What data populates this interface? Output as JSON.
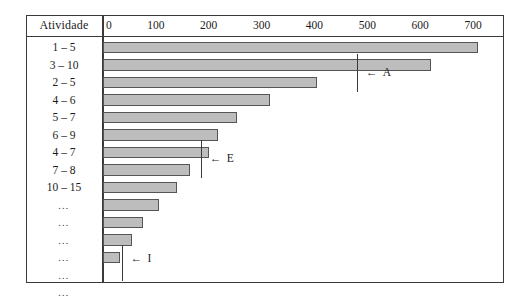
{
  "header": {
    "activity_column_label": "Atividade"
  },
  "axis": {
    "ticks": [
      "0",
      "100",
      "200",
      "300",
      "400",
      "500",
      "600",
      "700"
    ],
    "min": 0,
    "max": 760
  },
  "annotations": [
    {
      "id": "a",
      "label": "A",
      "arrow": "←",
      "value": 480
    },
    {
      "id": "e",
      "label": "E",
      "arrow": "←",
      "value": 185
    },
    {
      "id": "i",
      "label": "I",
      "arrow": "←",
      "value": 35
    }
  ],
  "rows": [
    {
      "label": "1 – 5",
      "value": 710
    },
    {
      "label": "3 – 10",
      "value": 620
    },
    {
      "label": "2 – 5",
      "value": 405
    },
    {
      "label": "4 – 6",
      "value": 315
    },
    {
      "label": "5 – 7",
      "value": 253
    },
    {
      "label": "6 – 9",
      "value": 218
    },
    {
      "label": "4 – 7",
      "value": 200
    },
    {
      "label": "7 – 8",
      "value": 165
    },
    {
      "label": "10 – 15",
      "value": 140
    },
    {
      "label": "…",
      "value": 105
    },
    {
      "label": "…",
      "value": 75
    },
    {
      "label": "…",
      "value": 55
    },
    {
      "label": "…",
      "value": 32
    },
    {
      "label": "…",
      "value": 0
    },
    {
      "label": "…",
      "value": 0
    }
  ],
  "colors": {
    "bar_fill": "#bdbdbd",
    "bar_border": "#555555",
    "frame": "#3a3a3a",
    "text": "#1b1b1b",
    "background": "#ffffff"
  },
  "chart_data": {
    "type": "bar",
    "orientation": "horizontal",
    "title": "",
    "subtitle": "",
    "xlabel": "",
    "ylabel": "Atividade",
    "xlim": [
      0,
      760
    ],
    "grid": false,
    "legend": null,
    "xticks": [
      0,
      100,
      200,
      300,
      400,
      500,
      600,
      700
    ],
    "categories": [
      "1 – 5",
      "3 – 10",
      "2 – 5",
      "4 – 6",
      "5 – 7",
      "6 – 9",
      "4 – 7",
      "7 – 8",
      "10 – 15",
      "…",
      "…",
      "…",
      "…",
      "…",
      "…"
    ],
    "values": [
      710,
      620,
      405,
      315,
      253,
      218,
      200,
      165,
      140,
      105,
      75,
      55,
      32,
      0,
      0
    ],
    "annotations": [
      {
        "text": "← A",
        "x": 480
      },
      {
        "text": "← E",
        "x": 185
      },
      {
        "text": "← I",
        "x": 35
      }
    ]
  }
}
